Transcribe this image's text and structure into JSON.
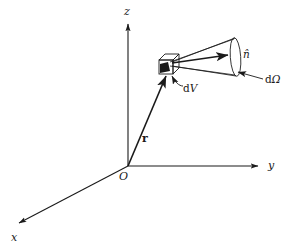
{
  "figure": {
    "name": "solid-angle-volume-element-diagram",
    "background_color": "#ffffff",
    "stroke_color": "#1a1a1a",
    "fill_color": "#1a1a1a",
    "axes": {
      "z": {
        "label": "z",
        "origin": [
          128,
          166
        ],
        "tip": [
          128,
          20
        ]
      },
      "y": {
        "label": "y",
        "origin": [
          128,
          166
        ],
        "tip": [
          262,
          166
        ]
      },
      "x": {
        "label": "x",
        "origin": [
          128,
          166
        ],
        "tip": [
          14,
          226
        ]
      }
    },
    "origin": {
      "label": "O",
      "point": [
        128,
        166
      ]
    },
    "position_vector": {
      "label": "r",
      "from": [
        128,
        166
      ],
      "to": [
        168,
        72
      ]
    },
    "volume_element": {
      "label": "d V",
      "label_op": "d",
      "label_var": "V",
      "center": [
        168,
        66
      ],
      "shape": "cube"
    },
    "direction_vector": {
      "label": "n̂",
      "from": [
        172,
        62
      ],
      "to": [
        234,
        54
      ]
    },
    "solid_angle": {
      "label": "dΩ",
      "label_op": "d",
      "label_var": "Ω",
      "apex": [
        172,
        63
      ],
      "base_center": [
        235,
        57
      ],
      "base_rx": 5,
      "base_ry": 19
    }
  },
  "labels": {
    "axis_z": "z",
    "axis_y": "y",
    "axis_x": "x",
    "origin": "O",
    "position_vector": "r",
    "volume_element_op": "d",
    "volume_element_var": "V",
    "direction_unit_vector": "n̂",
    "solid_angle_op": "d",
    "solid_angle_var": "Ω"
  }
}
